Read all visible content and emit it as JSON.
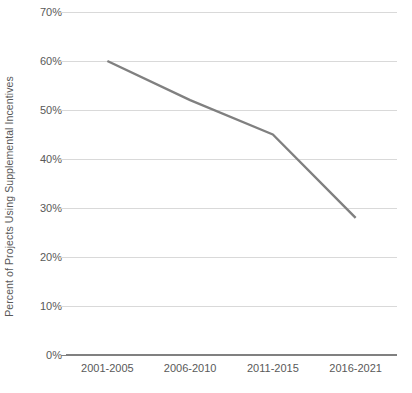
{
  "chart_data": {
    "type": "line",
    "title": "",
    "subtitle": "",
    "xlabel": "",
    "ylabel": "Percent of Projects Using Supplemental Incentives",
    "categories": [
      "2001-2005",
      "2006-2010",
      "2011-2015",
      "2016-2021"
    ],
    "values": [
      60,
      52,
      45,
      28
    ],
    "series": [
      {
        "name": "Percent of Projects Using Supplemental Incentives",
        "values": [
          60,
          52,
          45,
          28
        ]
      }
    ],
    "ylim": [
      0,
      70
    ],
    "y_ticks": [
      70,
      60,
      50,
      40,
      30,
      20,
      10,
      0
    ],
    "y_tick_labels": [
      "70%",
      "60%",
      "50%",
      "40%",
      "30%",
      "20%",
      "10%",
      "0%"
    ],
    "value_suffix": "%",
    "grid": true,
    "grid_axis": "y",
    "legend": false,
    "legend_position": "none",
    "markers": false,
    "line_color": "#808080",
    "grid_color": "#d9d9d9",
    "axis_color": "#808080",
    "text_color": "#595959",
    "background_color": "#ffffff"
  }
}
